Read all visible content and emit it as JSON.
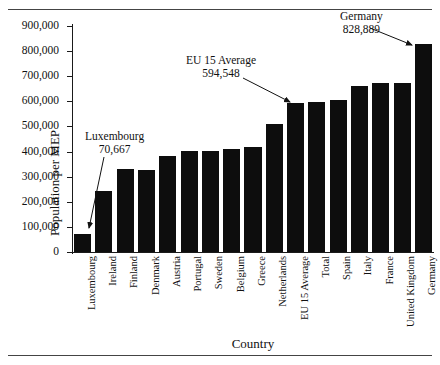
{
  "chart_data": {
    "type": "bar",
    "title": "",
    "xlabel": "Country",
    "ylabel": "Population per MEP",
    "ylim": [
      0,
      900000
    ],
    "ytick_step": 100000,
    "grid": false,
    "legend": null,
    "categories": [
      "Luxembourg",
      "Ireland",
      "Finland",
      "Denmark",
      "Austria",
      "Portugal",
      "Sweden",
      "Belgium",
      "Greece",
      "Netherlands",
      "EU 15 Average",
      "Total",
      "Spain",
      "Italy",
      "France",
      "United Kingdom",
      "Germany"
    ],
    "values": [
      70667,
      241000,
      330000,
      325000,
      383000,
      401000,
      404000,
      412000,
      420000,
      508000,
      594548,
      597000,
      607000,
      661000,
      675000,
      675000,
      828889
    ],
    "ytick_labels": [
      "0",
      "100,000",
      "200,000",
      "300,000",
      "400,000",
      "500,000",
      "600,000",
      "700,000",
      "800,000",
      "900,000"
    ],
    "bar_color": "#0d0d0d",
    "annotations": [
      {
        "name": "Luxembourg",
        "value": "70,667",
        "target_category": "Luxembourg"
      },
      {
        "name": "EU 15 Average",
        "value": "594,548",
        "target_category": "EU 15 Average"
      },
      {
        "name": "Germany",
        "value": "828,889",
        "target_category": "Germany"
      }
    ]
  }
}
